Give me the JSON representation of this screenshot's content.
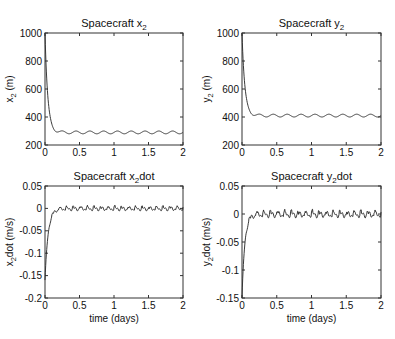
{
  "chart_data": [
    {
      "type": "line",
      "title": "Spacecraft x2",
      "title_main": "Spacecraft x",
      "title_sub": "2",
      "title_suffix": "",
      "ylabel": "x2 (m)",
      "ylabel_main": "x",
      "ylabel_sub": "2",
      "ylabel_suffix": " (m)",
      "xlabel": "",
      "xlim": [
        0,
        2
      ],
      "ylim": [
        200,
        1000
      ],
      "xticks": [
        "0",
        "0.5",
        "1",
        "1.5",
        "2"
      ],
      "yticks": [
        "200",
        "400",
        "600",
        "800",
        "1000"
      ],
      "grid": false,
      "description": "Decays from 1000 m at t=0 to ~290 m by t≈0.2 days, then small periodic oscillation (~±10 m, ~10 cycles over 2 days)",
      "initial": 1000,
      "steady": 290,
      "amplitude": 10,
      "tau": 0.04,
      "cycles": 10,
      "series": [
        {
          "name": "x2",
          "x": [
            0,
            0.05,
            0.1,
            0.15,
            0.2,
            0.5,
            1.0,
            1.5,
            2.0
          ],
          "values": [
            1000,
            560,
            360,
            300,
            292,
            290,
            295,
            285,
            285
          ]
        }
      ]
    },
    {
      "type": "line",
      "title": "Spacecraft y2",
      "title_main": "Spacecraft y",
      "title_sub": "2",
      "title_suffix": "",
      "ylabel": "y2 (m)",
      "ylabel_main": "y",
      "ylabel_sub": "2",
      "ylabel_suffix": " (m)",
      "xlabel": "",
      "xlim": [
        0,
        2
      ],
      "ylim": [
        200,
        1000
      ],
      "xticks": [
        "0",
        "0.5",
        "1",
        "1.5",
        "2"
      ],
      "yticks": [
        "200",
        "400",
        "600",
        "800",
        "1000"
      ],
      "grid": false,
      "description": "Decays from 1000 m at t=0 to ~410 m by t≈0.2 days, then small periodic oscillation (~±10 m)",
      "initial": 1000,
      "steady": 410,
      "amplitude": 10,
      "tau": 0.04,
      "cycles": 10,
      "series": [
        {
          "name": "y2",
          "x": [
            0,
            0.05,
            0.1,
            0.15,
            0.2,
            0.5,
            1.0,
            1.5,
            2.0
          ],
          "values": [
            1000,
            620,
            460,
            420,
            405,
            410,
            415,
            405,
            420
          ]
        }
      ]
    },
    {
      "type": "line",
      "title": "Spacecraft  x2dot",
      "title_main": "Spacecraft  x",
      "title_sub": "2",
      "title_suffix": "dot",
      "ylabel": "x2dot (m/s)",
      "ylabel_main": "x",
      "ylabel_sub": "2",
      "ylabel_suffix": "dot (m/s)",
      "xlabel": "time (days)",
      "xlim": [
        0,
        2
      ],
      "ylim": [
        -0.2,
        0.05
      ],
      "xticks": [
        "0",
        "0.5",
        "1",
        "1.5",
        "2"
      ],
      "yticks": [
        "-0.2",
        "-0.15",
        "-0.1",
        "-0.05",
        "0",
        "0.05"
      ],
      "grid": false,
      "description": "Starts near -0.16 m/s at t=0, rises to ~0 by t≈0.2 days, then jagged sawtooth oscillation around 0 (~±0.005)",
      "initial": -0.16,
      "steady": 0,
      "amplitude": 0.005,
      "tau": 0.045,
      "cycles": 20,
      "series": [
        {
          "name": "x2dot",
          "x": [
            0,
            0.02,
            0.05,
            0.1,
            0.2,
            0.5,
            1.0,
            1.5,
            2.0
          ],
          "values": [
            -0.16,
            -0.1,
            -0.05,
            -0.015,
            0.0,
            0.002,
            0.003,
            0.003,
            0.002
          ]
        }
      ]
    },
    {
      "type": "line",
      "title": "Spacecraft  y2dot",
      "title_main": "Spacecraft  y",
      "title_sub": "2",
      "title_suffix": "dot",
      "ylabel": "y2dot (m/s)",
      "ylabel_main": "y",
      "ylabel_sub": "2",
      "ylabel_suffix": "dot (m/s)",
      "xlabel": "time (days)",
      "xlim": [
        0,
        2
      ],
      "ylim": [
        -0.15,
        0.05
      ],
      "xticks": [
        "0",
        "0.5",
        "1",
        "1.5",
        "2"
      ],
      "yticks": [
        "-0.15",
        "-0.1",
        "-0.05",
        "0",
        "0.05"
      ],
      "grid": false,
      "description": "Starts near -0.15 m/s at t=0, rises to ~0 by t≈0.15 days, then jagged oscillation around 0 (~±0.006)",
      "initial": -0.15,
      "steady": 0,
      "amplitude": 0.006,
      "tau": 0.04,
      "cycles": 20,
      "series": [
        {
          "name": "y2dot",
          "x": [
            0,
            0.02,
            0.05,
            0.1,
            0.15,
            0.5,
            1.0,
            1.5,
            2.0
          ],
          "values": [
            -0.15,
            -0.09,
            -0.04,
            -0.01,
            -0.003,
            0.0,
            0.002,
            0.0,
            0.003
          ]
        }
      ]
    }
  ],
  "layout": {
    "panels": [
      {
        "x0": 45,
        "x1": 183,
        "y0": 33,
        "y1": 145
      },
      {
        "x0": 242,
        "x1": 381,
        "y0": 33,
        "y1": 145
      },
      {
        "x0": 45,
        "x1": 183,
        "y0": 186,
        "y1": 298
      },
      {
        "x0": 242,
        "x1": 381,
        "y0": 186,
        "y1": 298
      }
    ]
  }
}
